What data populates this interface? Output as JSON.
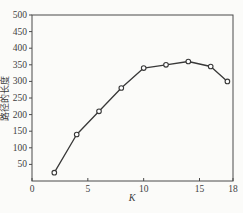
{
  "chart_data": {
    "type": "line",
    "title": "",
    "xlabel": "K",
    "ylabel": "路径的长度",
    "x": [
      2,
      4,
      6,
      8,
      10,
      12,
      14,
      16,
      17.5
    ],
    "y": [
      25,
      140,
      210,
      280,
      340,
      350,
      360,
      345,
      300
    ],
    "xlim": [
      0,
      18
    ],
    "ylim": [
      0,
      500
    ],
    "x_tick_values": [
      0,
      5,
      10,
      15,
      18
    ],
    "x_tick_labels": [
      "0",
      "5",
      "10",
      "15",
      "18"
    ],
    "y_tick_values": [
      50,
      100,
      150,
      200,
      250,
      300,
      350,
      400,
      450,
      500
    ],
    "y_tick_labels": [
      "50",
      "100",
      "150",
      "200",
      "250",
      "300",
      "350",
      "400",
      "450",
      "500"
    ],
    "grid": false,
    "legend": "none",
    "marker": "open-circle",
    "colors": {
      "line": "#383838",
      "axis": "#4a4a4a",
      "text": "#3e3e3e",
      "marker_fill": "#ffffff",
      "background": "#fbfbf9"
    }
  }
}
